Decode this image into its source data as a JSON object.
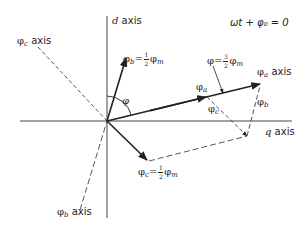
{
  "diagram": {
    "condition": "ωt + φ₀ = 0",
    "axes": {
      "d": {
        "label_var": "d",
        "label_word": "axis"
      },
      "q": {
        "label_var": "q",
        "label_word": "axis"
      },
      "phi_a": {
        "symbol": "φ",
        "sub": "a",
        "word": "axis"
      },
      "phi_b": {
        "symbol": "φ",
        "sub": "b",
        "word": "axis"
      },
      "phi_c": {
        "symbol": "φ",
        "sub": "c",
        "word": "axis"
      }
    },
    "vectors": {
      "phi_b": {
        "symbol": "φ",
        "sub": "b",
        "eq": "=",
        "num": "1",
        "den": "2",
        "rhs": "φ",
        "rhs_sub": "m"
      },
      "phi_c": {
        "symbol": "φ",
        "sub": "c",
        "eq": "=",
        "num": "1",
        "den": "2",
        "rhs": "φ",
        "rhs_sub": "m"
      },
      "phi_total": {
        "symbol": "φ",
        "eq": "=",
        "num": "3",
        "den": "2",
        "rhs": "φ",
        "rhs_sub": "m"
      }
    },
    "component_labels": {
      "phi_a": {
        "symbol": "φ",
        "sub": "a"
      },
      "phi_b": {
        "symbol": "φ",
        "sub": "b"
      },
      "phi_c": {
        "symbol": "φ",
        "sub": "c"
      }
    },
    "angle_label": "φ"
  }
}
